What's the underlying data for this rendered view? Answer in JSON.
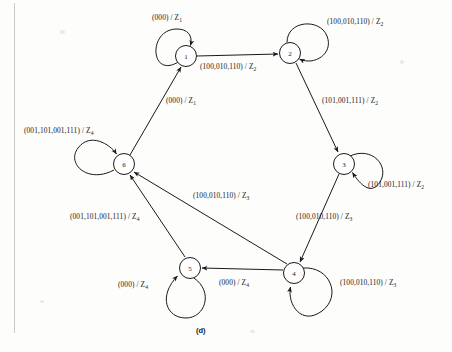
{
  "figure": {
    "caption": "(d)",
    "type": "state-transition-diagram",
    "ink_color": "#1a1a1a",
    "background_color": "#fdfdfc"
  },
  "states": [
    {
      "id": "1",
      "label": "1",
      "cx": 186,
      "cy": 56
    },
    {
      "id": "2",
      "label": "2",
      "cx": 290,
      "cy": 53
    },
    {
      "id": "3",
      "label": "3",
      "cx": 344,
      "cy": 164
    },
    {
      "id": "4",
      "label": "4",
      "cx": 294,
      "cy": 273
    },
    {
      "id": "5",
      "label": "5",
      "cx": 190,
      "cy": 268
    },
    {
      "id": "6",
      "label": "6",
      "cx": 124,
      "cy": 164
    }
  ],
  "transitions": [
    {
      "name": "self-loop-1",
      "from": "1",
      "to": "1",
      "inputs": "(000)",
      "output": "Z",
      "output_sub": "1",
      "label_x": 152,
      "label_y": 13
    },
    {
      "name": "edge-1-to-2",
      "from": "1",
      "to": "2",
      "inputs": "(100,010,110)",
      "output": "Z",
      "output_sub": "2",
      "label_x": 200,
      "label_y": 62
    },
    {
      "name": "self-loop-2",
      "from": "2",
      "to": "2",
      "inputs": "(100,010,110)",
      "output": "Z",
      "output_sub": "2",
      "label_x": 327,
      "label_y": 17
    },
    {
      "name": "edge-2-to-3",
      "from": "2",
      "to": "3",
      "inputs": "(101,001,111)",
      "output": "Z",
      "output_sub": "2",
      "label_x": 322,
      "label_y": 96
    },
    {
      "name": "self-loop-3",
      "from": "3",
      "to": "3",
      "inputs": "(101,001,111)",
      "output": "Z",
      "output_sub": "2",
      "label_x": 368,
      "label_y": 180
    },
    {
      "name": "edge-3-to-4",
      "from": "3",
      "to": "4",
      "inputs": "(100,010,110)",
      "output": "Z",
      "output_sub": "3",
      "label_x": 296,
      "label_y": 212
    },
    {
      "name": "self-loop-4",
      "from": "4",
      "to": "4",
      "inputs": "(100,010,110)",
      "output": "Z",
      "output_sub": "3",
      "label_x": 340,
      "label_y": 278
    },
    {
      "name": "edge-4-to-5",
      "from": "4",
      "to": "5",
      "inputs": "(000)",
      "output": "Z",
      "output_sub": "4",
      "label_x": 219,
      "label_y": 278
    },
    {
      "name": "edge-4-to-6",
      "from": "4",
      "to": "6",
      "inputs": "(100,010,110)",
      "output": "Z",
      "output_sub": "3",
      "label_x": 193,
      "label_y": 191
    },
    {
      "name": "self-loop-5",
      "from": "5",
      "to": "5",
      "inputs": "(000)",
      "output": "Z",
      "output_sub": "4",
      "label_x": 118,
      "label_y": 280
    },
    {
      "name": "edge-5-to-6",
      "from": "5",
      "to": "6",
      "inputs": "(001,101,001,111)",
      "output": "Z",
      "output_sub": "4",
      "label_x": 70,
      "label_y": 212
    },
    {
      "name": "self-loop-6",
      "from": "6",
      "to": "6",
      "inputs": "(001,101,001,111)",
      "output": "Z",
      "output_sub": "4",
      "label_x": 24,
      "label_y": 126
    },
    {
      "name": "edge-6-to-1",
      "from": "6",
      "to": "1",
      "inputs": "(000)",
      "output": "Z",
      "output_sub": "1",
      "label_x": 166,
      "label_y": 96
    }
  ]
}
